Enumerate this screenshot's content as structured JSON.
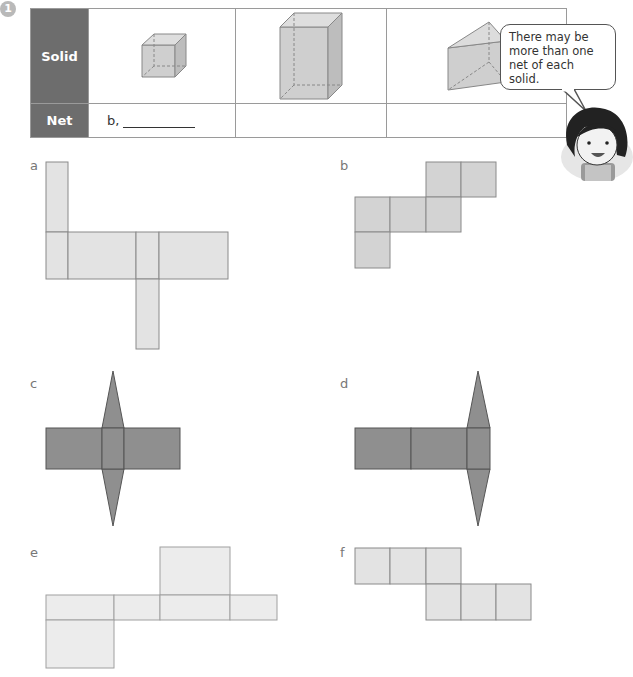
{
  "question": {
    "number": "1",
    "table": {
      "row_headers": [
        "Solid",
        "Net"
      ],
      "solids": [
        "cube-icon",
        "rectangular-prism-icon",
        "triangular-prism-icon"
      ],
      "answers": [
        {
          "prefix": "b,",
          "blank": true
        },
        {
          "prefix": "",
          "blank": false
        },
        {
          "prefix": "",
          "blank": false
        }
      ]
    },
    "speech_bubble": {
      "lines": [
        "There may be",
        "more than one",
        "net of each solid."
      ]
    }
  },
  "nets": [
    {
      "label": "a",
      "fill": "#e3e3e3"
    },
    {
      "label": "b",
      "fill": "#d3d3d3"
    },
    {
      "label": "c",
      "fill": "#8f8f8f"
    },
    {
      "label": "d",
      "fill": "#8f8f8f"
    },
    {
      "label": "e",
      "fill": "#ececec"
    },
    {
      "label": "f",
      "fill": "#e3e3e3"
    }
  ],
  "colors": {
    "header_bg": "#6d6d6d",
    "border": "#9a9a9a",
    "net_stroke": "#8a8a8a",
    "dark_net": "#8f8f8f"
  }
}
